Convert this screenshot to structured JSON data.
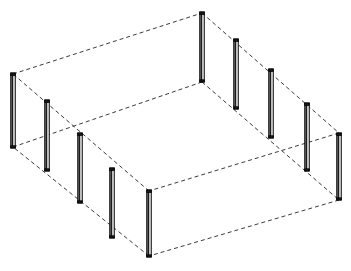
{
  "figure": {
    "kind": "line-drawing",
    "background_color": "#ffffff",
    "canvas": {
      "width": 351,
      "height": 271
    },
    "edge_style": {
      "color": "#3a3a42",
      "width": 1,
      "dash_pattern": "4 3",
      "description": "dashed"
    },
    "post_style": {
      "outline_color": "#000000",
      "fill_light": "#f2f2f2",
      "fill_dark": "#1c1c1c",
      "width_px": 4.5
    },
    "box": {
      "description": "Rectangular prism drawn in oblique/isometric projection using dashed edges",
      "top_face": {
        "name": "top-face",
        "vertices": [
          {
            "id": "top-back",
            "x": 202,
            "y": 13
          },
          {
            "id": "top-right",
            "x": 339,
            "y": 133
          },
          {
            "id": "top-front",
            "x": 149,
            "y": 191
          },
          {
            "id": "top-left",
            "x": 13,
            "y": 74
          }
        ]
      },
      "bottom_face": {
        "name": "bottom-face",
        "vertices": [
          {
            "id": "bot-back",
            "x": 202,
            "y": 82
          },
          {
            "id": "bot-right",
            "x": 339,
            "y": 200
          },
          {
            "id": "bot-front",
            "x": 149,
            "y": 256
          },
          {
            "id": "bot-left",
            "x": 13,
            "y": 147
          }
        ]
      },
      "vertical_edges": [
        {
          "id": "edge-back",
          "x": 202,
          "y1": 13,
          "y2": 82
        },
        {
          "id": "edge-right",
          "x": 339,
          "y1": 133,
          "y2": 200
        },
        {
          "id": "edge-front",
          "x": 149,
          "y1": 191,
          "y2": 256
        },
        {
          "id": "edge-left",
          "x": 13,
          "y1": 74,
          "y2": 147
        }
      ]
    },
    "posts": {
      "count": 12,
      "left_wall_label": "left-wall-posts",
      "right_wall_label": "right-wall-posts",
      "items": [
        {
          "id": "post-L1",
          "wall": "left",
          "x": 13.0,
          "y_top": 73,
          "y_bottom": 148,
          "height": 75
        },
        {
          "id": "post-L2",
          "wall": "left",
          "x": 47.0,
          "y_top": 100,
          "y_bottom": 171,
          "height": 71
        },
        {
          "id": "post-L3",
          "wall": "left",
          "x": 80.0,
          "y_top": 133,
          "y_bottom": 203,
          "height": 70
        },
        {
          "id": "post-L4",
          "wall": "left",
          "x": 112.0,
          "y_top": 168,
          "y_bottom": 238,
          "height": 70
        },
        {
          "id": "post-L5",
          "wall": "left",
          "x": 149.0,
          "y_top": 190,
          "y_bottom": 257,
          "height": 67
        },
        {
          "id": "post-B1",
          "wall": "back",
          "x": 202.0,
          "y_top": 12,
          "y_bottom": 82,
          "height": 70
        },
        {
          "id": "post-R1",
          "wall": "right",
          "x": 236.0,
          "y_top": 39,
          "y_bottom": 109,
          "height": 70
        },
        {
          "id": "post-R2",
          "wall": "right",
          "x": 271.0,
          "y_top": 69,
          "y_bottom": 138,
          "height": 69
        },
        {
          "id": "post-R3",
          "wall": "right",
          "x": 307.0,
          "y_top": 103,
          "y_bottom": 171,
          "height": 68
        },
        {
          "id": "post-R4",
          "wall": "right",
          "x": 339.0,
          "y_top": 133,
          "y_bottom": 200,
          "height": 67
        }
      ]
    },
    "extra_posts": [
      {
        "id": "post-M1",
        "wall": "back-right",
        "x": 236.0,
        "y_top": 39,
        "y_bottom": 109
      },
      {
        "id": "post-M2",
        "wall": "back-right",
        "x": 271.0,
        "y_top": 69,
        "y_bottom": 138
      }
    ]
  },
  "chart_data": {
    "type": "scatter",
    "xlabel": "",
    "ylabel": "",
    "xlim": [
      0,
      351
    ],
    "ylim": [
      271,
      0
    ],
    "grid": false,
    "legend": null,
    "series": [
      {
        "name": "posts",
        "description": "Vertical solid posts placed along enclosure perimeter (screen px)",
        "x": [
          13,
          47,
          80,
          112,
          149,
          202,
          236,
          271,
          307,
          339
        ],
        "y_top": [
          73,
          100,
          133,
          168,
          190,
          12,
          39,
          69,
          103,
          133
        ],
        "y_bottom": [
          148,
          171,
          203,
          238,
          257,
          82,
          109,
          138,
          171,
          200
        ],
        "values": [
          75,
          71,
          70,
          70,
          67,
          70,
          70,
          69,
          68,
          67
        ]
      }
    ],
    "annotations": []
  }
}
